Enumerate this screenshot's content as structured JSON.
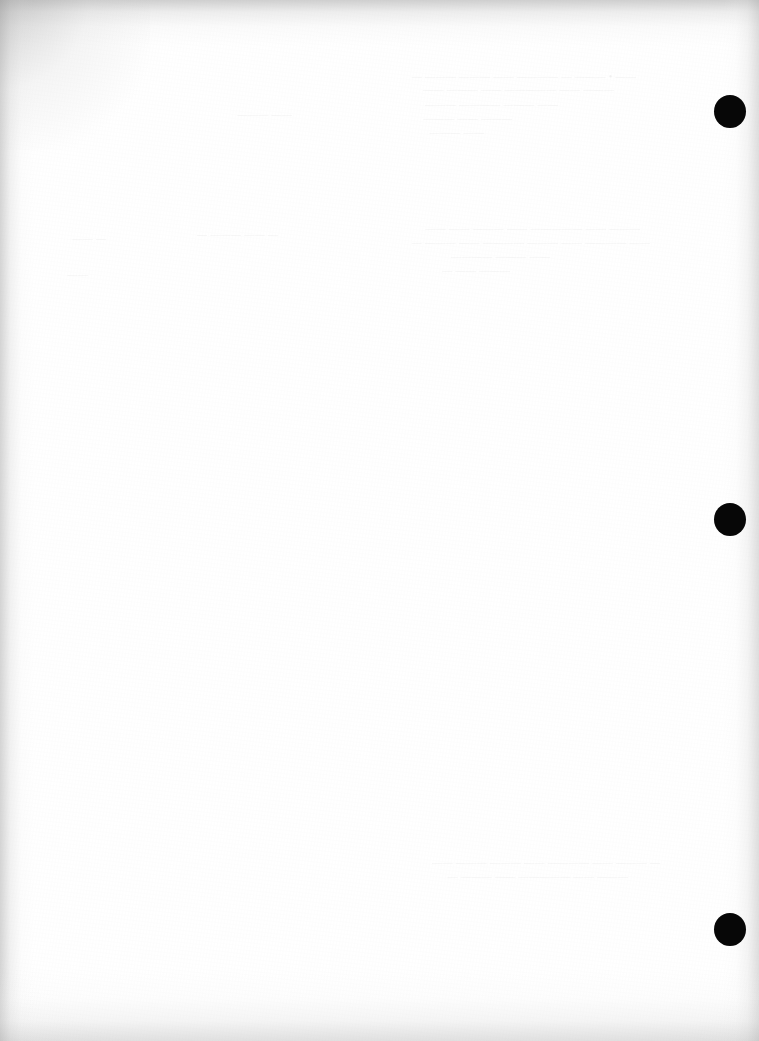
{
  "page": {
    "kind": "scanned-page",
    "orientation": "portrait",
    "width_px": 759,
    "height_px": 1041,
    "background_color": "#ffffff",
    "paper_tone": "#fdfdfd",
    "visible_text": "",
    "caption": ""
  },
  "colors": {
    "paper": "#ffffff",
    "paper_shade": "#f4f4f4",
    "edge_shadow": "#a8a8a8",
    "registration_mark": "#070707",
    "bleed_through_ink": "#2b2b2b"
  },
  "registration_marks": {
    "label": "registration-marks",
    "count": 3,
    "shape": "circle",
    "color": "#070707",
    "diameter_px": 32,
    "marks": [
      {
        "id": "mark-1",
        "center_x": 730,
        "center_y": 111,
        "diameter": 32
      },
      {
        "id": "mark-2",
        "center_x": 730,
        "center_y": 519,
        "diameter": 32
      },
      {
        "id": "mark-3",
        "center_x": 730,
        "center_y": 929,
        "diameter": 32
      }
    ]
  },
  "bleed_through": {
    "label": "show-through-from-reverse-side",
    "legible": false,
    "opacity": 0.055,
    "note": "Illegible mirrored ink bleed from the printed reverse of the sheet",
    "blocks": [
      {
        "id": "bleed-1",
        "x": 336,
        "y": 70,
        "width": 300,
        "height": 13,
        "size": 10,
        "text": "—— • ——— — ———— —— ——— ——— —"
      },
      {
        "id": "bleed-2",
        "x": 352,
        "y": 83,
        "width": 262,
        "height": 13,
        "size": 10,
        "text": "——— —— ————— —— ——— ——"
      },
      {
        "id": "bleed-3",
        "x": 366,
        "y": 98,
        "width": 192,
        "height": 13,
        "size": 10,
        "text": "—— ——— ———— ———"
      },
      {
        "id": "bleed-4",
        "x": 374,
        "y": 112,
        "width": 138,
        "height": 13,
        "size": 10,
        "text": "——— —— ———"
      },
      {
        "id": "bleed-5",
        "x": 382,
        "y": 126,
        "width": 102,
        "height": 13,
        "size": 10,
        "text": "—— ———"
      },
      {
        "id": "bleed-6",
        "x": 160,
        "y": 228,
        "width": 118,
        "height": 13,
        "size": 10,
        "text": "— —— ——— —"
      },
      {
        "id": "bleed-7",
        "x": 330,
        "y": 222,
        "width": 310,
        "height": 13,
        "size": 10,
        "text": "——— —— ————— —— ——— —— ——"
      },
      {
        "id": "bleed-8",
        "x": 312,
        "y": 236,
        "width": 338,
        "height": 13,
        "size": 10,
        "text": "—— ———— —— ——— ———— —— ——— —"
      },
      {
        "id": "bleed-9",
        "x": 400,
        "y": 250,
        "width": 150,
        "height": 13,
        "size": 10,
        "text": "—— ——— ————"
      },
      {
        "id": "bleed-10",
        "x": 402,
        "y": 264,
        "width": 108,
        "height": 13,
        "size": 10,
        "text": "——— —— —"
      },
      {
        "id": "bleed-11",
        "x": 336,
        "y": 856,
        "width": 324,
        "height": 13,
        "size": 10,
        "text": "— ——— —— ———— —— ——— ——— ——"
      },
      {
        "id": "bleed-12",
        "x": 356,
        "y": 870,
        "width": 272,
        "height": 13,
        "size": 10,
        "text": "——— —— ————— —— ——— —"
      },
      {
        "id": "bleed-13",
        "x": 196,
        "y": 108,
        "width": 96,
        "height": 13,
        "size": 10,
        "text": "—— ———"
      },
      {
        "id": "bleed-14",
        "x": 34,
        "y": 232,
        "width": 72,
        "height": 13,
        "size": 10,
        "text": "— ——"
      },
      {
        "id": "bleed-15",
        "x": 40,
        "y": 268,
        "width": 48,
        "height": 13,
        "size": 10,
        "text": "——"
      }
    ]
  }
}
